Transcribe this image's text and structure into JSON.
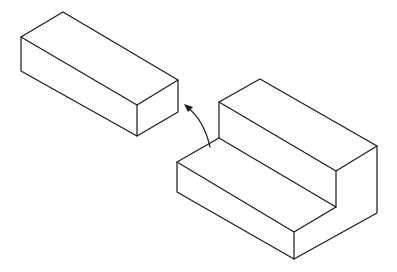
{
  "diagram": {
    "type": "isometric-assembly",
    "colors": {
      "line": "#1a1a1a",
      "background": "#ffffff"
    },
    "parts": [
      {
        "id": "rectangular-block",
        "label": ""
      },
      {
        "id": "step-block",
        "label": ""
      }
    ],
    "arrow": {
      "from": "step-block",
      "to": "rectangular-block",
      "style": "curved"
    }
  }
}
